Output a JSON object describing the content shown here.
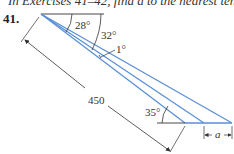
{
  "header": {
    "instruction": "In Exercises 41–42, find a to the nearest tenth."
  },
  "exercise": {
    "number": "41."
  },
  "figure": {
    "angles": {
      "top_inner": "28°",
      "top_outer": "32°",
      "small": "1°",
      "bottom": "35°"
    },
    "length_label": "450",
    "unknown_label": "a",
    "colors": {
      "ray": "#5b8fd6",
      "line": "#333333"
    }
  }
}
